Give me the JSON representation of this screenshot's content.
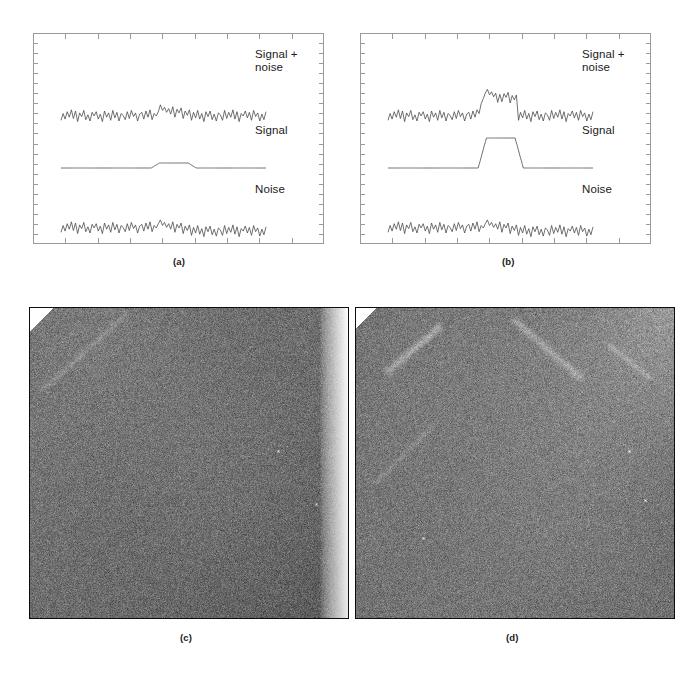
{
  "figure": {
    "kind": "multi-panel-scientific-figure",
    "background_color": "#ffffff",
    "ink_color": "#1a1a1a",
    "trace_color": "#555555"
  },
  "captions": [
    {
      "id": "caption-a",
      "text": "(a)",
      "x": 173,
      "y": 262
    },
    {
      "id": "caption-b",
      "text": "(b)",
      "x": 502,
      "y": 262
    },
    {
      "id": "caption-c",
      "text": "(c)",
      "x": 180,
      "y": 637
    },
    {
      "id": "caption-d",
      "text": "(d)",
      "x": 506,
      "y": 637
    }
  ],
  "panel_a": {
    "caption": "(a)",
    "frame": {
      "x": 33,
      "y": 33,
      "width": 291,
      "height": 211
    },
    "labels": {
      "signal_plus_noise": "Signal +\nnoise",
      "signal": "Signal",
      "noise": "Noise"
    },
    "label_positions": {
      "signal_plus_noise": {
        "x": 255,
        "y": 56
      },
      "signal": {
        "x": 255,
        "y": 130
      },
      "noise": {
        "x": 255,
        "y": 188
      }
    },
    "ticks": {
      "top_major": 9,
      "bottom_major": 9,
      "left_minor": 21,
      "right_minor": 21
    },
    "chart_data": {
      "type": "line",
      "title": "",
      "xlabel": "",
      "ylabel": "",
      "grid": false,
      "legend": "inline-right-labels",
      "xlim": [
        0,
        100
      ],
      "note": "Weak signal buried in noise: signal amplitude is small compared with noise sigma.",
      "signal_pulse": {
        "start": 44,
        "rise_end": 48,
        "fall_start": 62,
        "end": 66,
        "amplitude": 5
      },
      "noise_sigma": 9,
      "series": [
        {
          "name": "Signal + noise",
          "row": 1,
          "baseline_y": 83,
          "values": [
            -7,
            4,
            -5,
            7,
            -2,
            10,
            -4,
            8,
            -9,
            5,
            -1,
            9,
            -6,
            2,
            -8,
            6,
            0,
            7,
            -5,
            3,
            -9,
            8,
            -2,
            5,
            -7,
            9,
            -3,
            6,
            -8,
            4,
            1,
            -6,
            7,
            -4,
            9,
            -1,
            5,
            -8,
            3,
            6,
            -5,
            8,
            -2,
            10,
            -6,
            4,
            0,
            7,
            18,
            9,
            14,
            6,
            12,
            3,
            15,
            -2,
            11,
            5,
            13,
            -4,
            8,
            1,
            10,
            -7,
            6,
            -3,
            9,
            -5,
            4,
            -9,
            7,
            -1,
            8,
            -6,
            3,
            -8,
            5,
            2,
            -7,
            9,
            -4,
            6,
            -2,
            10,
            -5,
            7,
            -9,
            4,
            0,
            8,
            -3,
            6,
            -7,
            9,
            -1,
            5,
            -8,
            3,
            -6,
            7
          ],
          "sampled_from": "noise + signal"
        },
        {
          "name": "Signal",
          "row": 2,
          "baseline_y": 135,
          "pulse_amplitude": 5,
          "shape": "trapezoid"
        },
        {
          "name": "Noise",
          "row": 3,
          "baseline_y": 195,
          "values": [
            -7,
            4,
            -5,
            7,
            -2,
            10,
            -4,
            8,
            -9,
            5,
            -1,
            9,
            -6,
            2,
            -8,
            6,
            0,
            7,
            -5,
            3,
            -9,
            8,
            -2,
            5,
            -7,
            9,
            -3,
            6,
            -8,
            4,
            1,
            -6,
            7,
            -4,
            9,
            -1,
            5,
            -8,
            3,
            6,
            -5,
            8,
            -2,
            10,
            -6,
            4,
            0,
            7,
            13,
            4,
            9,
            1,
            7,
            -2,
            10,
            -7,
            6,
            0,
            8,
            -9,
            3,
            -4,
            5,
            -12,
            1,
            -8,
            4,
            -10,
            -1,
            -14,
            2,
            -6,
            3,
            -11,
            -2,
            -13,
            0,
            -3,
            -12,
            4,
            -9,
            1,
            -7,
            5,
            -10,
            2,
            -14,
            -1,
            -5,
            3,
            -8,
            1,
            -12,
            4,
            -6,
            0,
            -13,
            -2,
            -11,
            2
          ],
          "sampled_from": "gaussian noise"
        }
      ]
    }
  },
  "panel_b": {
    "caption": "(b)",
    "frame": {
      "x": 360,
      "y": 33,
      "width": 291,
      "height": 211
    },
    "labels": {
      "signal_plus_noise": "Signal +\nnoise",
      "signal": "Signal",
      "noise": "Noise"
    },
    "label_positions": {
      "signal_plus_noise": {
        "x": 582,
        "y": 56
      },
      "signal": {
        "x": 582,
        "y": 130
      },
      "noise": {
        "x": 582,
        "y": 188
      }
    },
    "ticks": {
      "top_major": 9,
      "bottom_major": 9,
      "left_minor": 21,
      "right_minor": 21
    },
    "chart_data": {
      "type": "line",
      "title": "",
      "xlabel": "",
      "ylabel": "",
      "grid": false,
      "legend": "inline-right-labels",
      "xlim": [
        0,
        100
      ],
      "note": "Strong signal clearly visible above the same noise: pulse amplitude roughly 30 units versus noise sigma 9.",
      "signal_pulse": {
        "start": 44,
        "rise_end": 48,
        "fall_start": 62,
        "end": 66,
        "amplitude": 30
      },
      "noise_sigma": 9,
      "series": [
        {
          "name": "Signal + noise",
          "row": 1,
          "baseline_y": 83,
          "values": [
            -7,
            4,
            -5,
            7,
            -2,
            10,
            -4,
            8,
            -9,
            5,
            -1,
            9,
            -6,
            2,
            -8,
            6,
            0,
            7,
            -5,
            3,
            -9,
            8,
            -2,
            5,
            -7,
            9,
            -3,
            6,
            -8,
            4,
            1,
            -6,
            7,
            -4,
            9,
            -1,
            5,
            -8,
            3,
            6,
            -5,
            8,
            -2,
            10,
            4,
            20,
            28,
            37,
            43,
            34,
            39,
            31,
            37,
            22,
            35,
            23,
            36,
            30,
            38,
            21,
            33,
            26,
            34,
            -7,
            6,
            -3,
            9,
            -5,
            4,
            -9,
            7,
            -1,
            8,
            -6,
            3,
            -8,
            5,
            2,
            -7,
            9,
            -4,
            6,
            -2,
            10,
            -5,
            7,
            -9,
            4,
            0,
            8,
            -3,
            6,
            -7,
            9,
            -1,
            5,
            -8,
            3,
            -6,
            7
          ],
          "sampled_from": "noise + signal"
        },
        {
          "name": "Signal",
          "row": 2,
          "baseline_y": 135,
          "pulse_amplitude": 30,
          "shape": "trapezoid"
        },
        {
          "name": "Noise",
          "row": 3,
          "baseline_y": 195,
          "values": [
            -7,
            4,
            -5,
            7,
            -2,
            10,
            -4,
            8,
            -9,
            5,
            -1,
            9,
            -6,
            2,
            -8,
            6,
            0,
            7,
            -5,
            3,
            -9,
            8,
            -2,
            5,
            -7,
            9,
            -3,
            6,
            -8,
            4,
            1,
            -6,
            7,
            -4,
            9,
            -1,
            5,
            -8,
            3,
            6,
            -5,
            8,
            -2,
            10,
            -6,
            4,
            0,
            7,
            13,
            4,
            9,
            1,
            7,
            -2,
            10,
            -7,
            6,
            0,
            8,
            -9,
            3,
            -4,
            5,
            -12,
            1,
            -8,
            4,
            -10,
            -1,
            -14,
            2,
            -6,
            3,
            -11,
            -2,
            -13,
            0,
            -3,
            -12,
            4,
            -9,
            1,
            -7,
            5,
            -10,
            2,
            -14,
            -1,
            -5,
            3,
            -8,
            1,
            -12,
            4,
            -6,
            0,
            -13,
            -2,
            -11,
            2
          ],
          "sampled_from": "gaussian noise"
        }
      ]
    }
  },
  "panel_c": {
    "caption": "(c)",
    "frame": {
      "x": 29,
      "y": 307,
      "width": 320,
      "height": 312
    },
    "description": "Noisy grayscale detector image with a bright vertical band down the right edge, a white triangular corner at top-left and a faint diagonal streak.",
    "border_color": "#0d0d0d",
    "base_gray": "#787878",
    "noise_sigma": 14,
    "features": [
      {
        "name": "bright-right-band",
        "type": "vertical-gradient-band",
        "x_start": 0.91,
        "x_end": 1.0,
        "peak_brightness": 255
      },
      {
        "name": "white-corner-top-left",
        "type": "triangle",
        "size": 0.07,
        "brightness": 255
      },
      {
        "name": "diagonal-streak-top-left",
        "type": "streak",
        "angle_deg": 40,
        "brightness_delta": 22
      },
      {
        "name": "hot-pixel-1",
        "type": "point",
        "x": 0.78,
        "y": 0.46,
        "brightness": 230
      },
      {
        "name": "hot-pixel-2",
        "type": "point",
        "x": 0.9,
        "y": 0.63,
        "brightness": 215
      },
      {
        "name": "dark-vignette-corner-bottom-right",
        "type": "vignette",
        "brightness_delta": -18
      }
    ]
  },
  "panel_d": {
    "caption": "(d)",
    "frame": {
      "x": 355,
      "y": 307,
      "width": 320,
      "height": 312
    },
    "description": "Noisy grayscale detector image showing several bright diagonal streaks (cosmic-ray / satellite trails), a bright glow in the top-right corner and isolated hot pixels.",
    "border_color": "#0d0d0d",
    "base_gray": "#7c7c7c",
    "noise_sigma": 14,
    "features": [
      {
        "name": "streak-upper-left",
        "type": "streak",
        "angle_deg": 40,
        "x1": 0.1,
        "y1": 0.2,
        "x2": 0.26,
        "y2": 0.06,
        "brightness_delta": 45,
        "width": 4
      },
      {
        "name": "streak-upper-right-long",
        "type": "streak",
        "angle_deg": -40,
        "x1": 0.5,
        "y1": 0.04,
        "x2": 0.7,
        "y2": 0.22,
        "brightness_delta": 35,
        "width": 4
      },
      {
        "name": "streak-upper-right-short",
        "type": "streak",
        "angle_deg": -40,
        "x1": 0.8,
        "y1": 0.12,
        "x2": 0.92,
        "y2": 0.22,
        "brightness_delta": 28,
        "width": 3
      },
      {
        "name": "streak-mid-left-faint",
        "type": "streak",
        "angle_deg": 45,
        "x1": 0.06,
        "y1": 0.56,
        "x2": 0.24,
        "y2": 0.38,
        "brightness_delta": 18,
        "width": 3
      },
      {
        "name": "glow-top-right-corner",
        "type": "radial-glow",
        "x": 1.0,
        "y": 0.0,
        "brightness_delta": 40
      },
      {
        "name": "white-corner-top-left",
        "type": "triangle",
        "size": 0.06,
        "brightness": 255
      },
      {
        "name": "hot-pixel-1",
        "type": "point",
        "x": 0.86,
        "y": 0.46,
        "brightness": 245
      },
      {
        "name": "hot-pixel-2",
        "type": "point",
        "x": 0.91,
        "y": 0.62,
        "brightness": 235
      },
      {
        "name": "hot-pixel-3",
        "type": "point",
        "x": 0.21,
        "y": 0.74,
        "brightness": 225
      }
    ]
  }
}
